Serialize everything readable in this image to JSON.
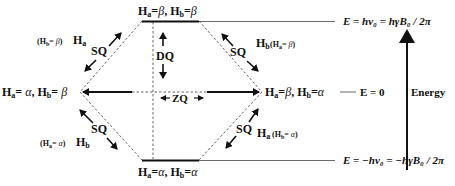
{
  "diagram": {
    "levels": {
      "top": {
        "ha": "β",
        "hb": "β",
        "energy": "E = hν₀ = hγB₀ / 2π"
      },
      "left": {
        "ha": "α",
        "hb": "β"
      },
      "right": {
        "ha": "β",
        "hb": "α",
        "energy": "E = 0"
      },
      "bottom": {
        "ha": "α",
        "hb": "α",
        "energy": "E = −hν₀ = −hγB₀ / 2π"
      }
    },
    "transitions": {
      "sq_label": "SQ",
      "dq_label": "DQ",
      "zq_label": "ZQ",
      "sq_top_left": {
        "spin": "Ha",
        "condition": "(Hb= β)"
      },
      "sq_top_right": {
        "spin": "Hb",
        "condition": "(Ha= β)"
      },
      "sq_bottom_left": {
        "spin": "Hb",
        "condition": "(Ha= α)"
      },
      "sq_bottom_right": {
        "spin": "Ha",
        "condition": "(Hb= α)"
      }
    },
    "axis": {
      "label": "Energy"
    },
    "text": {
      "top_level": "Ha= β, Hb= β",
      "left_level": "Ha= α, Hb= β",
      "right_level": "Ha= β, Hb= α",
      "bottom_level": "Ha= α, Hb= α"
    }
  }
}
